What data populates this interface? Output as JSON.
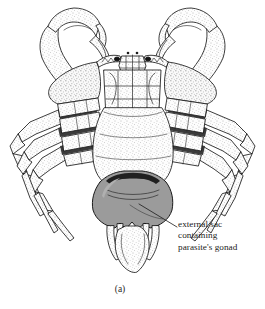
{
  "figure": {
    "caption": "(a)",
    "background_color": "#ffffff",
    "ink_color": "#1b1b1b"
  },
  "annotation": {
    "line1": "external sac",
    "line2": "containing",
    "line3": "parasite's gonad",
    "leader_line": {
      "from_x": 139,
      "from_y": 204,
      "to_x": 177,
      "to_y": 227
    }
  },
  "illustration": {
    "parasite_sac": {
      "label": "external sac containing parasite's gonad",
      "fill_color": "#9b9b9b",
      "stroke_color": "#1b1b1b"
    },
    "body": {
      "label": "crab-carapace-ventral",
      "fill_color": "#fbfbfb",
      "stipple_color": "#6e6e6e"
    },
    "claws": {
      "count": 2,
      "label": "chelipeds"
    },
    "walking_legs": {
      "count": 8,
      "label": "pereiopods"
    },
    "joint_shadow_color": "#3a3a3a"
  }
}
